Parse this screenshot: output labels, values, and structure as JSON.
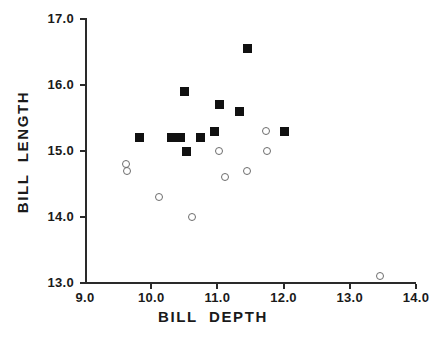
{
  "chart_data": {
    "type": "scatter",
    "title": "",
    "xlabel": "BILL  DEPTH",
    "ylabel": "BILL  LENGTH",
    "xlim": [
      9.0,
      14.0
    ],
    "ylim": [
      13.0,
      17.0
    ],
    "xticks": [
      9.0,
      10.0,
      11.0,
      12.0,
      13.0,
      14.0
    ],
    "yticks": [
      13.0,
      14.0,
      15.0,
      16.0,
      17.0
    ],
    "xtick_labels": [
      "9.0",
      "10.0",
      "11.0",
      "12.0",
      "13.0",
      "14.0"
    ],
    "ytick_labels": [
      "13.0",
      "14.0",
      "15.0",
      "16.0",
      "17.0"
    ],
    "grid": false,
    "legend": null,
    "series": [
      {
        "name": "filled-square",
        "marker": "filled-square",
        "color": "#111111",
        "points": [
          {
            "x": 9.83,
            "y": 15.2
          },
          {
            "x": 10.3,
            "y": 15.2
          },
          {
            "x": 10.45,
            "y": 15.2
          },
          {
            "x": 10.5,
            "y": 15.9
          },
          {
            "x": 10.53,
            "y": 15.0
          },
          {
            "x": 10.75,
            "y": 15.2
          },
          {
            "x": 10.95,
            "y": 15.3
          },
          {
            "x": 11.03,
            "y": 15.7
          },
          {
            "x": 11.33,
            "y": 15.6
          },
          {
            "x": 11.45,
            "y": 16.55
          },
          {
            "x": 12.02,
            "y": 15.3
          }
        ]
      },
      {
        "name": "open-circle",
        "marker": "open-circle",
        "color": "#6d6d6d",
        "points": [
          {
            "x": 9.62,
            "y": 14.8
          },
          {
            "x": 9.63,
            "y": 14.7
          },
          {
            "x": 10.12,
            "y": 14.3
          },
          {
            "x": 10.62,
            "y": 14.0
          },
          {
            "x": 11.02,
            "y": 15.0
          },
          {
            "x": 11.12,
            "y": 14.6
          },
          {
            "x": 11.45,
            "y": 14.7
          },
          {
            "x": 11.73,
            "y": 15.3
          },
          {
            "x": 11.75,
            "y": 15.0
          },
          {
            "x": 13.45,
            "y": 13.1
          }
        ]
      }
    ]
  }
}
